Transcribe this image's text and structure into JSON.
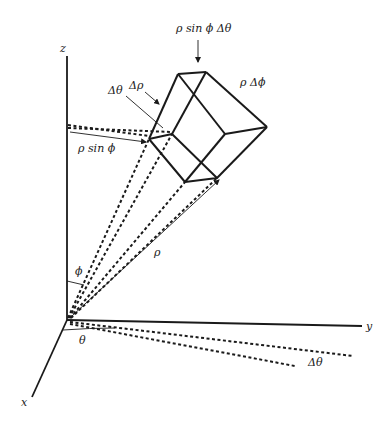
{
  "diagram": {
    "axes": {
      "z_label": "z",
      "y_label": "y",
      "x_label": "x"
    },
    "labels": {
      "rho_sin_phi_dtheta": "ρ sin ϕ Δθ",
      "rho_dphi": "ρ Δϕ",
      "delta_rho": "Δρ",
      "delta_theta_top": "Δθ",
      "rho_sin_phi": "ρ sin ϕ",
      "rho": "ρ",
      "phi": "ϕ",
      "theta": "θ",
      "delta_theta_bottom": "Δθ"
    }
  }
}
